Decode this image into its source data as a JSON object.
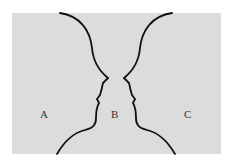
{
  "figure": {
    "labels": {
      "a": "A",
      "b": "B",
      "c": "C"
    },
    "colors": {
      "background": "#dcdcdc",
      "line": "#111111",
      "page": "#ffffff"
    }
  }
}
